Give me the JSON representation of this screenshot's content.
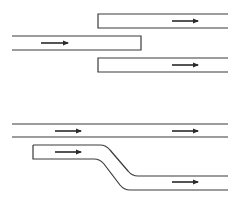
{
  "diagram": {
    "type": "lane-configuration",
    "colors": {
      "line": "#3a3a3a",
      "arrow": "#2a2a2a",
      "background": "#ffffff"
    },
    "panels": [
      {
        "name": "lane-split",
        "lanes": [
          {
            "name": "upper-right-lane",
            "x1": 98,
            "x2": 228,
            "y_top": 14,
            "y_bottom": 28,
            "closed_end": "left",
            "arrows": [
              {
                "x1": 172,
                "x2": 198,
                "y": 21,
                "direction": "right"
              }
            ]
          },
          {
            "name": "left-lane",
            "x1": 12,
            "x2": 141,
            "y_top": 36,
            "y_bottom": 50,
            "closed_end": "right",
            "arrows": [
              {
                "x1": 41,
                "x2": 68,
                "y": 43,
                "direction": "right"
              }
            ]
          },
          {
            "name": "lower-right-lane",
            "x1": 98,
            "x2": 228,
            "y_top": 58,
            "y_bottom": 72,
            "closed_end": "left",
            "arrows": [
              {
                "x1": 172,
                "x2": 198,
                "y": 65,
                "direction": "right"
              }
            ]
          }
        ]
      },
      {
        "name": "lane-shift",
        "lanes": [
          {
            "name": "through-lane",
            "x1": 12,
            "x2": 228,
            "y_top": 124,
            "y_bottom": 137,
            "closed_end": "none",
            "arrows": [
              {
                "x1": 55,
                "x2": 81,
                "y": 131,
                "direction": "right"
              },
              {
                "x1": 172,
                "x2": 198,
                "y": 131,
                "direction": "right"
              }
            ]
          },
          {
            "name": "shifting-lane",
            "closed_end": "left",
            "arrows": [
              {
                "x1": 55,
                "x2": 81,
                "y": 152,
                "direction": "right"
              },
              {
                "x1": 172,
                "x2": 198,
                "y": 182,
                "direction": "right"
              }
            ]
          }
        ]
      }
    ]
  }
}
